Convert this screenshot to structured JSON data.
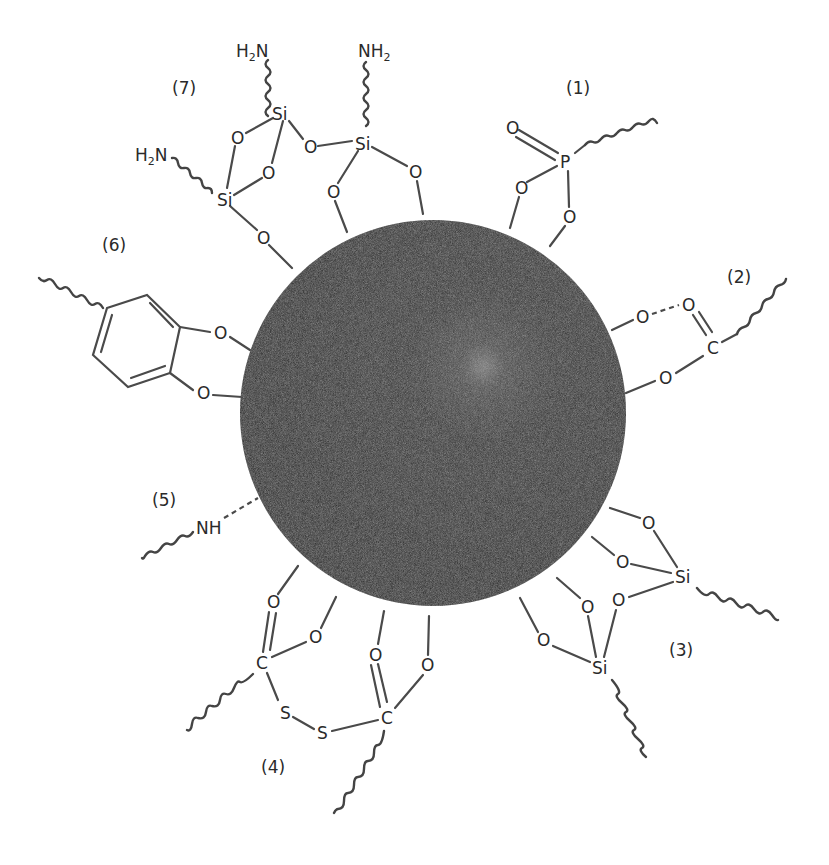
{
  "figure": {
    "core": {
      "label": "nanoparticle-core",
      "color": "#2e2e2e",
      "highlight": "#7a7a7a"
    },
    "groups": [
      {
        "id": "1",
        "label": "(1)",
        "type": "phosphonate",
        "atoms": [
          "O",
          "P",
          "O",
          "O"
        ]
      },
      {
        "id": "2",
        "label": "(2)",
        "type": "carboxylate",
        "atoms": [
          "O",
          "O",
          "C",
          "O"
        ]
      },
      {
        "id": "3",
        "label": "(3)",
        "type": "silane",
        "atoms": [
          "O",
          "O",
          "Si",
          "O",
          "O",
          "O",
          "Si"
        ]
      },
      {
        "id": "4",
        "label": "(4)",
        "type": "dithiocarboxylate-disulfide",
        "atoms": [
          "O",
          "O",
          "C",
          "S",
          "S",
          "C",
          "O",
          "O"
        ]
      },
      {
        "id": "5",
        "label": "(5)",
        "type": "amine",
        "atoms": [
          "NH"
        ]
      },
      {
        "id": "6",
        "label": "(6)",
        "type": "catechol",
        "atoms": [
          "O",
          "O"
        ]
      },
      {
        "id": "7",
        "label": "(7)",
        "type": "aminosilane",
        "atoms": [
          "H2N",
          "NH2",
          "H2N",
          "Si",
          "Si",
          "Si",
          "O",
          "O",
          "O",
          "O",
          "O",
          "O"
        ]
      }
    ],
    "atom_labels": {
      "O": "O",
      "P": "P",
      "C": "C",
      "Si": "Si",
      "S": "S",
      "NH": "NH",
      "H": "H",
      "N": "N",
      "two": "2"
    }
  }
}
